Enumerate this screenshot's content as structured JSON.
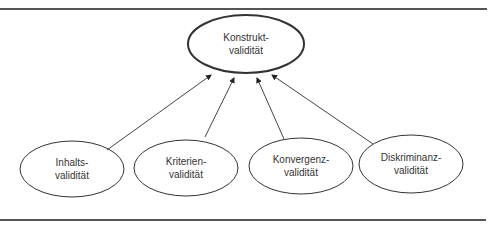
{
  "diagram": {
    "type": "construct-validity-hierarchy",
    "colors": {
      "stroke": "#333333",
      "rule": "#555555",
      "text": "#333333",
      "background": "#ffffff"
    },
    "top_node": {
      "id": "konstrukt",
      "line1": "Konstrukt-",
      "line2": "validität",
      "cx": 246,
      "cy": 44,
      "rx": 58,
      "ry": 29
    },
    "child_nodes": [
      {
        "id": "inhalts",
        "line1": "Inhalts-",
        "line2": "validität",
        "cx": 72,
        "cy": 169,
        "rx": 52,
        "ry": 28
      },
      {
        "id": "kriterien",
        "line1": "Kriterien-",
        "line2": "validität",
        "cx": 186,
        "cy": 168,
        "rx": 52,
        "ry": 28
      },
      {
        "id": "konvergenz",
        "line1": "Konvergenz-",
        "line2": "validität",
        "cx": 301,
        "cy": 166,
        "rx": 52,
        "ry": 28
      },
      {
        "id": "diskriminanz",
        "line1": "Diskriminanz-",
        "line2": "validität",
        "cx": 411,
        "cy": 164,
        "rx": 52,
        "ry": 29
      }
    ],
    "edges": [
      {
        "from": "inhalts",
        "to": "konstrukt",
        "x1": 107,
        "y1": 150,
        "x2": 211,
        "y2": 75
      },
      {
        "from": "kriterien",
        "to": "konstrukt",
        "x1": 205,
        "y1": 137,
        "x2": 234,
        "y2": 78
      },
      {
        "from": "konvergenz",
        "to": "konstrukt",
        "x1": 284,
        "y1": 139,
        "x2": 257,
        "y2": 78
      },
      {
        "from": "diskriminanz",
        "to": "konstrukt",
        "x1": 373,
        "y1": 144,
        "x2": 272,
        "y2": 75
      }
    ],
    "rules": [
      {
        "position": "top",
        "y": 8,
        "x1": 0,
        "x2": 487
      },
      {
        "position": "bottom",
        "y": 219,
        "x1": 0,
        "x2": 486
      }
    ]
  }
}
